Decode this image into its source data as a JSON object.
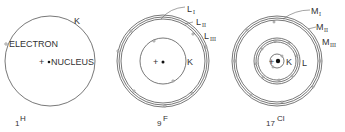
{
  "atoms": [
    {
      "symbol": "H",
      "atomic_number": "1",
      "labels": {
        "shell": "K",
        "electron": "ELECTRON",
        "nucleus": "NUCLEUS",
        "plus": "+"
      }
    },
    {
      "symbol": "F",
      "atomic_number": "9",
      "labels": {
        "k_shell": "K",
        "subshells": [
          "L",
          "L",
          "L"
        ],
        "subshell_indices": [
          "I",
          "II",
          "III"
        ],
        "plus": "+"
      }
    },
    {
      "symbol": "Cl",
      "atomic_number": "17",
      "labels": {
        "k_shell": "K",
        "l_shell": "L",
        "subshells": [
          "M",
          "M",
          "M"
        ],
        "subshell_indices": [
          "I",
          "II",
          "III"
        ],
        "plus": "+"
      }
    }
  ]
}
